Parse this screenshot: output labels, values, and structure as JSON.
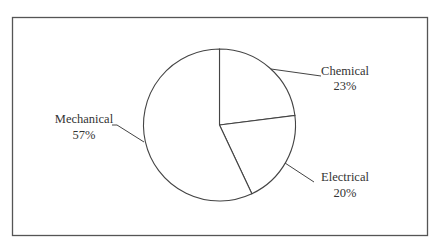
{
  "chart_data": {
    "type": "pie",
    "title": "",
    "categories": [
      "Chemical",
      "Electrical",
      "Mechanical"
    ],
    "values": [
      23,
      20,
      57
    ],
    "value_labels": [
      "23%",
      "20%",
      "57%"
    ],
    "start_angle": "12 o'clock, clockwise",
    "legend": "none (leader-line data labels)",
    "fill": "#ffffff",
    "stroke": "#444444"
  },
  "labels": {
    "chemical_name": "Chemical",
    "chemical_pct": "23%",
    "electrical_name": "Electrical",
    "electrical_pct": "20%",
    "mechanical_name": "Mechanical",
    "mechanical_pct": "57%"
  }
}
